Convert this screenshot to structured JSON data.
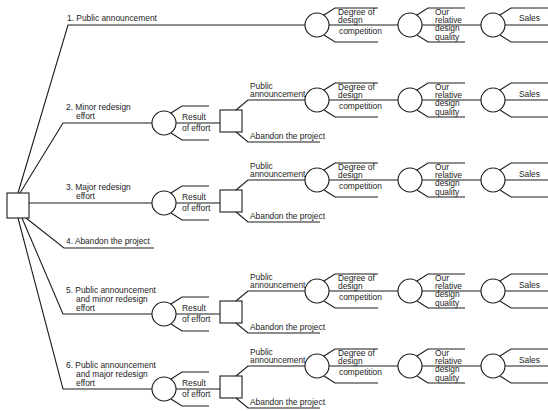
{
  "diagram": {
    "type": "decision-tree",
    "root": {
      "kind": "decision",
      "shape": "square"
    },
    "alternatives": [
      {
        "number": "1.",
        "lines": [
          "Public announcement"
        ]
      },
      {
        "number": "2.",
        "lines": [
          "Minor redesign",
          "effort"
        ]
      },
      {
        "number": "3.",
        "lines": [
          "Major redesign",
          "effort"
        ]
      },
      {
        "number": "4.",
        "lines": [
          "Abandon the project"
        ]
      },
      {
        "number": "5.",
        "lines": [
          "Public announcement",
          "and minor redesign",
          "effort"
        ]
      },
      {
        "number": "6.",
        "lines": [
          "Public announcement",
          "and major redesign",
          "effort"
        ]
      }
    ],
    "chance_result": {
      "line1": "Result",
      "line2": "of effort"
    },
    "second_decision": {
      "public": {
        "line1": "Public",
        "line2": "announcement"
      },
      "abandon": "Abandon the project"
    },
    "competition": {
      "line1": "Degree of",
      "line2": "design",
      "line3": "competition"
    },
    "quality": {
      "line1": "Our",
      "line2": "relative",
      "line3": "design",
      "line4": "quality"
    },
    "sales": "Sales"
  }
}
